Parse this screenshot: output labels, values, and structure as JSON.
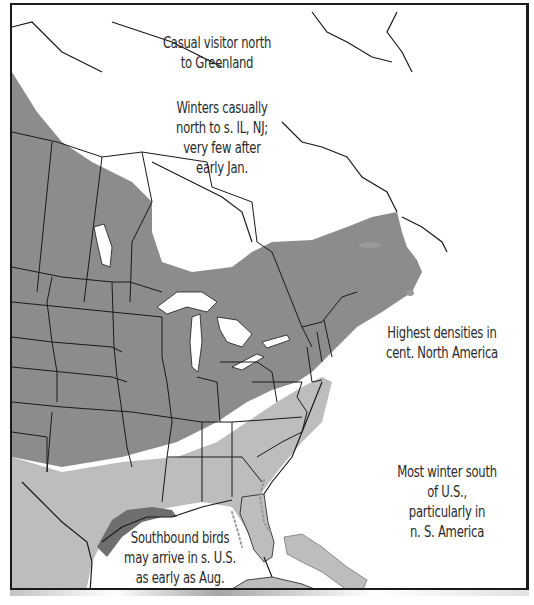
{
  "map": {
    "type": "species-range-map",
    "subject": "winter range",
    "region": "Eastern North America",
    "colors": {
      "high_density": "#8c8c8c",
      "low_density": "#bdbdbd",
      "coastal_migrant": "#6e6e6e",
      "land_outside_range": "#ffffff",
      "water": "#ffffff",
      "borders": "#1a1a1a",
      "frame": "#1a1a1a"
    },
    "legend_zones": [
      {
        "name": "Highest density (dark grey)",
        "color": "#8c8c8c"
      },
      {
        "name": "Lower density (light grey)",
        "color": "#bdbdbd"
      },
      {
        "name": "Gulf coast early arrival (darkest grey)",
        "color": "#6e6e6e"
      },
      {
        "name": "Dotted line: coastal migration",
        "color": "#9a9a9a"
      }
    ]
  },
  "annotations": {
    "greenland": {
      "line1": "Casual visitor north",
      "line2": "to Greenland"
    },
    "winters_casually": {
      "line1": "Winters casually",
      "line2": "north to s. IL, NJ;",
      "line3": "very few after",
      "line4": "early Jan."
    },
    "highest_densities": {
      "line1": "Highest densities in",
      "line2": "cent. North America"
    },
    "most_winter": {
      "line1": "Most winter south",
      "line2": "of U.S.,",
      "line3": "particularly in",
      "line4": "n. S. America"
    },
    "southbound": {
      "line1": "Southbound birds",
      "line2": "may arrive in s. U.S.",
      "line3": "as early as Aug."
    }
  }
}
